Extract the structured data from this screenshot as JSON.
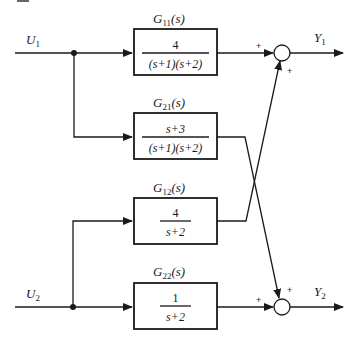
{
  "diagram": {
    "type": "MIMO block diagram",
    "inputs": [
      {
        "id": "U1",
        "label": "U",
        "sub": "1"
      },
      {
        "id": "U2",
        "label": "U",
        "sub": "2"
      }
    ],
    "outputs": [
      {
        "id": "Y1",
        "label": "Y",
        "sub": "1"
      },
      {
        "id": "Y2",
        "label": "Y",
        "sub": "2"
      }
    ],
    "blocks": [
      {
        "id": "G11",
        "name": "G",
        "sub": "11",
        "arg": "(s)",
        "numerator": "4",
        "denominator": "(s+1)(s+2)",
        "from": "U1",
        "to": "sum1"
      },
      {
        "id": "G21",
        "name": "G",
        "sub": "21",
        "arg": "(s)",
        "numerator": "s+3",
        "denominator": "(s+1)(s+2)",
        "from": "U1",
        "to": "sum2"
      },
      {
        "id": "G12",
        "name": "G",
        "sub": "12",
        "arg": "(s)",
        "numerator": "4",
        "denominator": "s+2",
        "from": "U2",
        "to": "sum1"
      },
      {
        "id": "G22",
        "name": "G",
        "sub": "22",
        "arg": "(s)",
        "numerator": "1",
        "denominator": "s+2",
        "from": "U2",
        "to": "sum2"
      }
    ],
    "summers": [
      {
        "id": "sum1",
        "signs": [
          "+",
          "+"
        ],
        "output": "Y1"
      },
      {
        "id": "sum2",
        "signs": [
          "+",
          "+"
        ],
        "output": "Y2"
      }
    ]
  }
}
